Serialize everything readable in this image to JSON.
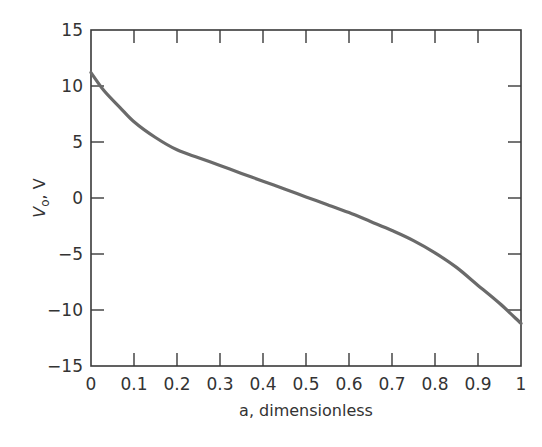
{
  "chart_data": {
    "type": "line",
    "title": "",
    "xlabel": "a, dimensionless",
    "ylabel_main": "V",
    "ylabel_sub": "o",
    "ylabel_rest": ", V",
    "xlim": [
      0,
      1
    ],
    "ylim": [
      -15,
      15
    ],
    "xticks": [
      0,
      0.1,
      0.2,
      0.3,
      0.4,
      0.5,
      0.6,
      0.7,
      0.8,
      0.9,
      1
    ],
    "xtick_labels": [
      "0",
      "0.1",
      "0.2",
      "0.3",
      "0.4",
      "0.5",
      "0.6",
      "0.7",
      "0.8",
      "0.9",
      "1"
    ],
    "yticks": [
      15,
      10,
      5,
      0,
      -5,
      -10,
      -15
    ],
    "ytick_labels": [
      "15",
      "10",
      "5",
      "0",
      "−5",
      "−10",
      "−15"
    ],
    "grid": false,
    "legend": "none",
    "series": [
      {
        "name": "Vo",
        "color": "#6a6a6a",
        "x": [
          0,
          0.03,
          0.067,
          0.1,
          0.15,
          0.2,
          0.25,
          0.3,
          0.35,
          0.4,
          0.45,
          0.5,
          0.55,
          0.6,
          0.65,
          0.7,
          0.75,
          0.8,
          0.85,
          0.9,
          0.95,
          1.0
        ],
        "y": [
          11.2,
          9.6,
          8.1,
          6.8,
          5.4,
          4.3,
          3.6,
          2.9,
          2.2,
          1.5,
          0.8,
          0.1,
          -0.6,
          -1.3,
          -2.1,
          -2.9,
          -3.8,
          -4.9,
          -6.2,
          -7.8,
          -9.4,
          -11.2
        ]
      }
    ]
  }
}
